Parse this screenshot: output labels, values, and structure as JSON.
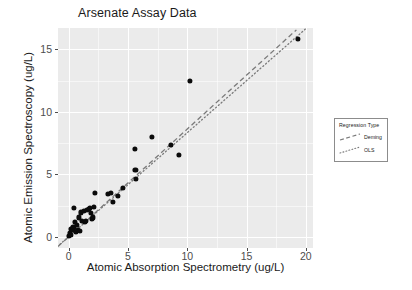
{
  "chart_data": {
    "type": "scatter",
    "title": "Arsenate Assay Data",
    "xlabel": "Atomic Absorption Spectrometry (ug/L)",
    "ylabel": "Atomic Emission Spectroscopy (ug/L)",
    "xlim": [
      -0.9,
      20.6
    ],
    "ylim": [
      -0.9,
      16.7
    ],
    "xticks": [
      0,
      5,
      10,
      15,
      20
    ],
    "xticklabels": [
      "0",
      "5",
      "10",
      "15",
      "20"
    ],
    "yticks": [
      0,
      5,
      10,
      15
    ],
    "yticklabels": [
      "0",
      "5",
      "10",
      "15"
    ],
    "grid": true,
    "grid_color": "#ffffff",
    "panel_color": "#ebebeb",
    "point_color": "#0b0b0b",
    "legend_position": "right",
    "points": [
      {
        "x": 0.05,
        "y": 0.05
      },
      {
        "x": 0.12,
        "y": 0.3
      },
      {
        "x": 0.18,
        "y": 0.62
      },
      {
        "x": 0.22,
        "y": 0.18
      },
      {
        "x": 0.35,
        "y": 0.52
      },
      {
        "x": 0.4,
        "y": 0.75
      },
      {
        "x": 0.46,
        "y": 2.3
      },
      {
        "x": 0.55,
        "y": 1.18
      },
      {
        "x": 0.62,
        "y": 0.42
      },
      {
        "x": 0.7,
        "y": 0.95
      },
      {
        "x": 0.78,
        "y": 0.55
      },
      {
        "x": 0.85,
        "y": 1.55
      },
      {
        "x": 0.95,
        "y": 0.48
      },
      {
        "x": 1.05,
        "y": 1.95
      },
      {
        "x": 1.12,
        "y": 1.28
      },
      {
        "x": 1.25,
        "y": 2.05
      },
      {
        "x": 1.35,
        "y": 1.2
      },
      {
        "x": 1.48,
        "y": 1.3
      },
      {
        "x": 1.55,
        "y": 2.15
      },
      {
        "x": 1.7,
        "y": 2.22
      },
      {
        "x": 1.78,
        "y": 2.3
      },
      {
        "x": 1.88,
        "y": 1.92
      },
      {
        "x": 1.95,
        "y": 1.45
      },
      {
        "x": 2.05,
        "y": 1.55
      },
      {
        "x": 2.12,
        "y": 2.38
      },
      {
        "x": 2.2,
        "y": 3.52
      },
      {
        "x": 3.3,
        "y": 3.45
      },
      {
        "x": 3.55,
        "y": 3.48
      },
      {
        "x": 3.7,
        "y": 2.78
      },
      {
        "x": 4.15,
        "y": 3.28
      },
      {
        "x": 4.55,
        "y": 3.88
      },
      {
        "x": 5.55,
        "y": 7.02
      },
      {
        "x": 5.62,
        "y": 5.38
      },
      {
        "x": 5.7,
        "y": 4.62
      },
      {
        "x": 7.0,
        "y": 7.98
      },
      {
        "x": 8.6,
        "y": 7.35
      },
      {
        "x": 9.3,
        "y": 6.58
      },
      {
        "x": 10.2,
        "y": 12.48
      },
      {
        "x": 19.3,
        "y": 15.82
      }
    ],
    "lines": [
      {
        "name": "Deming",
        "style": "dashed",
        "color": "#7a7a7a",
        "x0": -0.9,
        "y0": -0.78,
        "x1": 19.2,
        "y1": 16.55
      },
      {
        "name": "OLS",
        "style": "dotted",
        "color": "#7a7a7a",
        "x0": -0.75,
        "y0": -0.62,
        "x1": 20.0,
        "y1": 16.65
      }
    ],
    "legend": {
      "title": "Regression Type",
      "entries": [
        {
          "label": "Deming",
          "style": "dashed"
        },
        {
          "label": "OLS",
          "style": "dotted"
        }
      ]
    }
  }
}
